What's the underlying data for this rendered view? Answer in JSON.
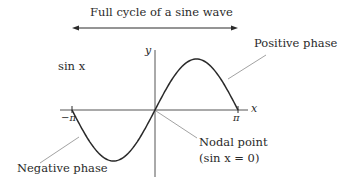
{
  "diagram": {
    "title": "Full cycle of a sine wave",
    "function_label": "sin x",
    "axes": {
      "x_label": "x",
      "y_label": "y",
      "x_ticks": [
        {
          "label": "−π",
          "value": -3.14159
        },
        {
          "label": "π",
          "value": 3.14159
        }
      ]
    },
    "annotations": {
      "positive_phase": "Positive phase",
      "negative_phase": "Negative phase",
      "nodal_point": "Nodal point",
      "nodal_condition": "(sin x = 0)"
    },
    "curve": {
      "function": "sin",
      "domain": [
        -3.14159,
        3.14159
      ],
      "peak": {
        "x": 1.5708,
        "y": 1
      },
      "trough": {
        "x": -1.5708,
        "y": -1
      },
      "nodes": [
        -3.14159,
        0,
        3.14159
      ]
    },
    "colors": {
      "curve": "#2a2a2a",
      "axis": "#555555",
      "leader": "#8a8a8a",
      "text": "#2a2a2a"
    }
  }
}
